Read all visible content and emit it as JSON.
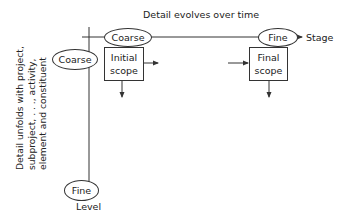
{
  "diagram": {
    "title": "Detail evolves over time",
    "horizontal_axis": {
      "label": "Stage",
      "start_node": "Coarse",
      "end_node": "Fine"
    },
    "vertical_axis": {
      "label": "Level",
      "description_lines": [
        "Detail unfolds with project,",
        "subproject, . . ., activity,",
        "element and constituent"
      ],
      "start_node": "Coarse",
      "end_node": "Fine"
    },
    "boxes": [
      {
        "line1": "Initial",
        "line2": "scope"
      },
      {
        "line1": "Final",
        "line2": "scope"
      }
    ],
    "colors": {
      "line": "#333333",
      "text": "#222222",
      "background": "#ffffff"
    }
  }
}
